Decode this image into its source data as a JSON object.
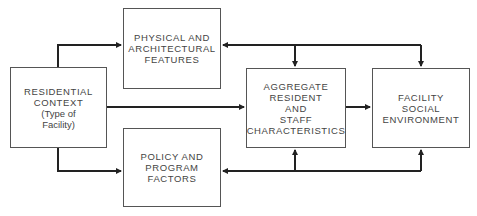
{
  "diagram": {
    "nodes": [
      {
        "id": "residential",
        "lines": [
          "RESIDENTIAL",
          "CONTEXT",
          "(Type of",
          "Facility)"
        ]
      },
      {
        "id": "physical",
        "lines": [
          "PHYSICAL AND",
          "ARCHITECTURAL",
          "FEATURES"
        ]
      },
      {
        "id": "policy",
        "lines": [
          "POLICY AND",
          "PROGRAM",
          "FACTORS"
        ]
      },
      {
        "id": "aggregate",
        "lines": [
          "AGGREGATE",
          "RESIDENT",
          "AND",
          "STAFF",
          "CHARACTERISTICS"
        ]
      },
      {
        "id": "facility",
        "lines": [
          "FACILITY",
          "SOCIAL",
          "ENVIRONMENT"
        ]
      }
    ],
    "edges": [
      {
        "from": "residential",
        "to": "physical"
      },
      {
        "from": "residential",
        "to": "policy"
      },
      {
        "from": "residential",
        "to": "aggregate"
      },
      {
        "from": "aggregate",
        "to": "facility"
      },
      {
        "from": "facility",
        "to": "physical"
      },
      {
        "from": "facility",
        "to": "aggregate",
        "via": "top"
      },
      {
        "from": "physical",
        "to": "aggregate",
        "via": "top"
      },
      {
        "from": "facility",
        "to": "policy"
      },
      {
        "from": "policy",
        "to": "aggregate",
        "via": "bottom"
      },
      {
        "from": "policy",
        "to": "facility",
        "via": "bottom"
      }
    ]
  }
}
